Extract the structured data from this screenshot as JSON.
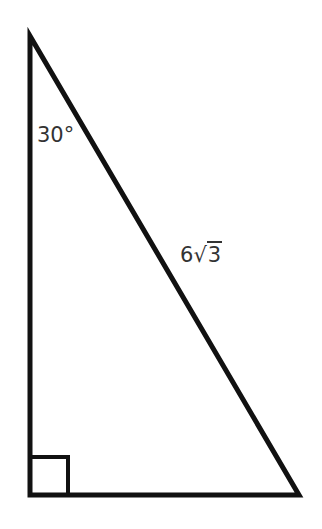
{
  "diagram": {
    "type": "right-triangle",
    "colors": {
      "stroke": "#111111",
      "label": "#333333",
      "background": "#ffffff"
    },
    "vertices": {
      "top": [
        30,
        36
      ],
      "right_angle": [
        30,
        495
      ],
      "bottom_right": [
        299,
        495
      ]
    },
    "right_angle_marker": {
      "size": 38
    },
    "labels": {
      "angle": "30°",
      "hypotenuse_coefficient": "6",
      "hypotenuse_radical_symbol": "√",
      "hypotenuse_radicand": "3"
    }
  }
}
